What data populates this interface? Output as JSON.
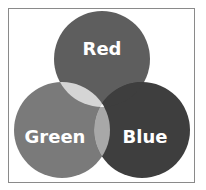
{
  "diagram": {
    "type": "venn",
    "sets": [
      {
        "id": "red",
        "label": "Red",
        "fill": "#5e5e5e",
        "cx": 102,
        "cy": 59,
        "r": 48
      },
      {
        "id": "green",
        "label": "Green",
        "fill": "#7a7a7a",
        "cx": 62,
        "cy": 130,
        "r": 48
      },
      {
        "id": "blue",
        "label": "Blue",
        "fill": "#3e3e3e",
        "cx": 142,
        "cy": 130,
        "r": 48
      }
    ],
    "overlaps": {
      "red_green": "#d5d5d5",
      "green_blue": "#a8a8a8",
      "red_blue": "#3e3e3e",
      "all": "#f4f4f4"
    }
  }
}
